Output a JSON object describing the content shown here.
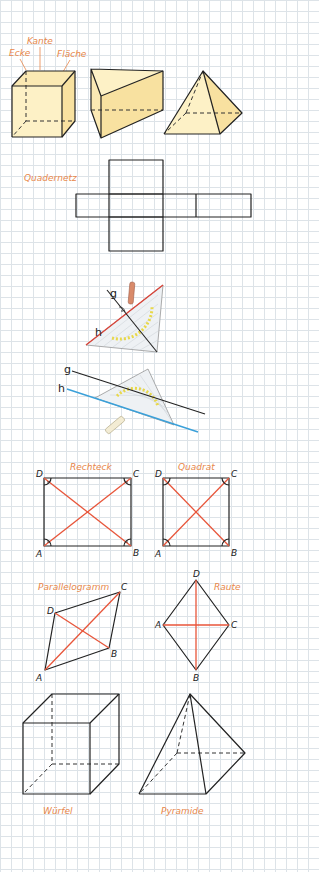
{
  "colors": {
    "grid": "#dde3e8",
    "label": "#e8874a",
    "diagonal": "#e8553a",
    "edge": "#222222",
    "solid_fill_light": "#fdf1c6",
    "solid_fill_dark": "#f8e1a0",
    "line_g": "#222222",
    "line_h_perp": "#d9453a",
    "line_h_parallel": "#3aa0d9",
    "protractor_ticks": "#e8d84a"
  },
  "solids_row": {
    "labels": {
      "corner": "Ecke",
      "edge": "Kante",
      "face": "Fläche"
    },
    "shapes": [
      "cuboid",
      "triangular-prism",
      "square-pyramid"
    ]
  },
  "net": {
    "title": "Quadernetz"
  },
  "set_square": {
    "perpendicular": {
      "line_g": "g",
      "line_h": "h"
    },
    "parallel": {
      "line_g": "g",
      "line_h": "h"
    }
  },
  "quadrilaterals": {
    "rectangle": {
      "title": "Rechteck",
      "vertices": [
        "A",
        "B",
        "C",
        "D"
      ]
    },
    "square": {
      "title": "Quadrat",
      "vertices": [
        "A",
        "B",
        "C",
        "D"
      ]
    },
    "parallelogram": {
      "title": "Parallelogramm",
      "vertices": [
        "A",
        "B",
        "C",
        "D"
      ]
    },
    "rhombus": {
      "title": "Raute",
      "vertices": [
        "A",
        "B",
        "C",
        "D"
      ]
    }
  },
  "wireframes": {
    "cube": {
      "title": "Würfel"
    },
    "pyramid": {
      "title": "Pyramide"
    }
  }
}
